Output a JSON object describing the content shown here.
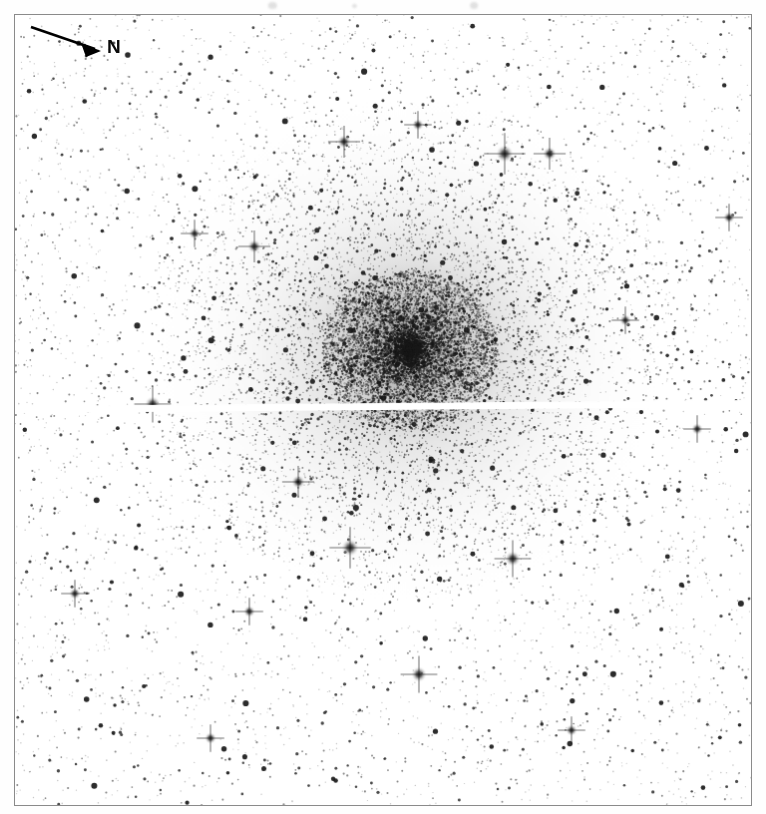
{
  "figure": {
    "kind": "astronomical-image",
    "frame": {
      "x": 14,
      "y": 14,
      "width": 738,
      "height": 792,
      "border_color": "#8a8a8a"
    },
    "background_color": "#ffffff",
    "star_color": "#1a1a1a"
  },
  "compass": {
    "north_label": "N",
    "arrow_from": [
      8,
      10
    ],
    "arrow_to": [
      78,
      34
    ],
    "arrow_color": "#000000"
  },
  "chart_data": {
    "type": "scatter",
    "title": "",
    "xlabel": "",
    "ylabel": "",
    "xlim": [
      0,
      738
    ],
    "ylim": [
      0,
      792
    ],
    "grid": false,
    "legend": "none",
    "annotations": [
      {
        "text": "N",
        "role": "compass-direction",
        "x": 84,
        "y": 26
      }
    ],
    "field": {
      "background_star_count": 5200,
      "cluster_star_count": 9000,
      "cluster_center": [
        396,
        336
      ],
      "cluster_core_radius": 80,
      "cluster_halo_radius": 255,
      "chip_gap": {
        "y_left": 392,
        "y_right": 386,
        "thickness": 7,
        "color": "#ffffff"
      }
    },
    "bright_stars": [
      {
        "x": 491,
        "y": 139,
        "size": 9,
        "spikes": true
      },
      {
        "x": 536,
        "y": 139,
        "size": 7,
        "spikes": true
      },
      {
        "x": 240,
        "y": 232,
        "size": 7,
        "spikes": true
      },
      {
        "x": 180,
        "y": 219,
        "size": 6,
        "spikes": true
      },
      {
        "x": 138,
        "y": 390,
        "size": 8,
        "spikes": true
      },
      {
        "x": 284,
        "y": 468,
        "size": 7,
        "spikes": true
      },
      {
        "x": 336,
        "y": 534,
        "size": 9,
        "spikes": true
      },
      {
        "x": 499,
        "y": 545,
        "size": 8,
        "spikes": true
      },
      {
        "x": 235,
        "y": 598,
        "size": 6,
        "spikes": true
      },
      {
        "x": 405,
        "y": 661,
        "size": 8,
        "spikes": true
      },
      {
        "x": 716,
        "y": 203,
        "size": 6,
        "spikes": true
      },
      {
        "x": 684,
        "y": 415,
        "size": 6,
        "spikes": true
      },
      {
        "x": 60,
        "y": 580,
        "size": 6,
        "spikes": true
      },
      {
        "x": 330,
        "y": 127,
        "size": 7,
        "spikes": true
      },
      {
        "x": 404,
        "y": 110,
        "size": 6,
        "spikes": true
      },
      {
        "x": 612,
        "y": 306,
        "size": 6,
        "spikes": true
      },
      {
        "x": 196,
        "y": 725,
        "size": 6,
        "spikes": true
      },
      {
        "x": 558,
        "y": 717,
        "size": 6,
        "spikes": true
      }
    ]
  },
  "scan_artifacts": [
    {
      "x": 268,
      "y": 2,
      "w": 9,
      "h": 7
    },
    {
      "x": 470,
      "y": 2,
      "w": 8,
      "h": 7
    },
    {
      "x": 352,
      "y": 4,
      "w": 5,
      "h": 4
    }
  ]
}
